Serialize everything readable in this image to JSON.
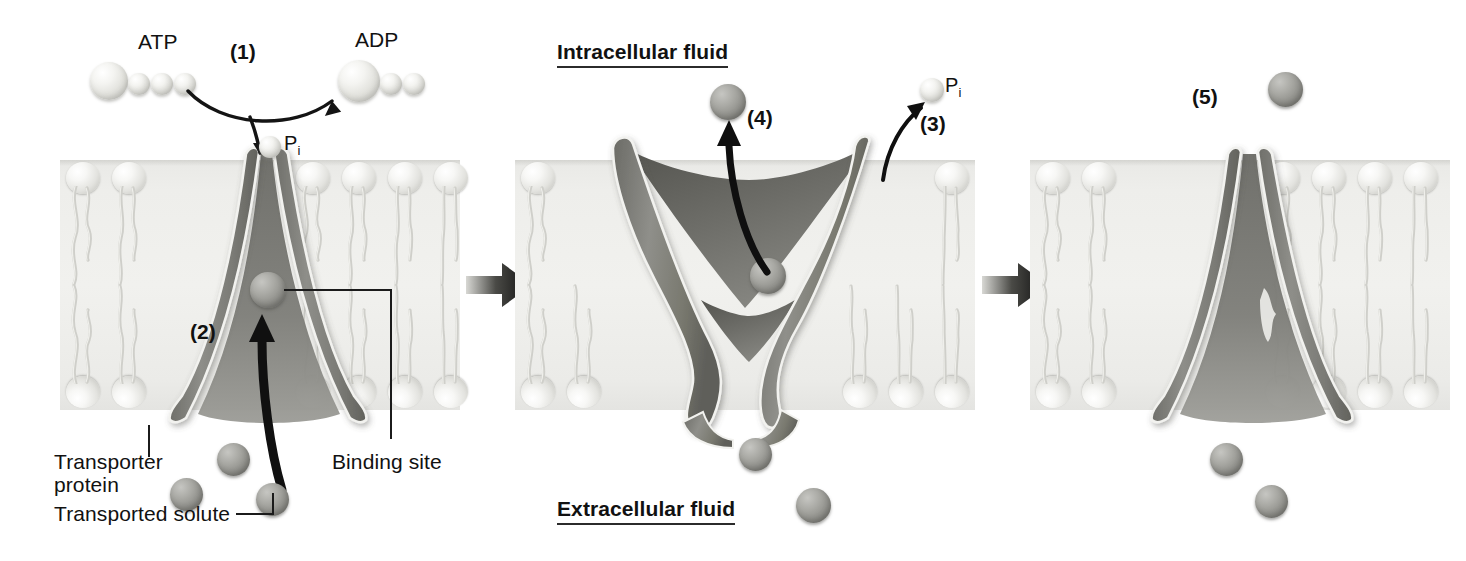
{
  "figure": {
    "type": "cell-membrane-process-diagram",
    "panel_count": 3
  },
  "compartments": {
    "intracellular": "Intracellular fluid",
    "extracellular": "Extracellular fluid"
  },
  "molecules": {
    "atp": "ATP",
    "adp": "ADP",
    "phosphate": "P",
    "phosphate_sub": "i"
  },
  "steps": {
    "s1": "(1)",
    "s2": "(2)",
    "s3": "(3)",
    "s4": "(4)",
    "s5": "(5)"
  },
  "annotations": {
    "transporter_line1": "Transporter",
    "transporter_line2": "protein",
    "solute": "Transported solute",
    "binding_site": "Binding site"
  },
  "colors": {
    "background": "#ffffff",
    "membrane_band": "#eeeeeb",
    "lipid_head": "#e3e3df",
    "protein_fill": "#8d8d88",
    "protein_dark": "#6e6e69",
    "solute_sphere": "#8e8e89",
    "arrow_black": "#111111",
    "text": "#111111"
  },
  "panels": [
    {
      "id": "panel-1",
      "caption": "ATP is hydrolyzed to ADP and phosphate; phosphate binds the transporter while solute binds the binding site",
      "conformation": "open-to-extracellular",
      "steps_shown": [
        "(1)",
        "(2)"
      ],
      "labels": [
        "ATP",
        "ADP",
        "Pi",
        "Transporter protein",
        "Transported solute",
        "Binding site"
      ]
    },
    {
      "id": "panel-2",
      "caption": "Transporter changes shape, releases phosphate and moves solute to the intracellular fluid",
      "conformation": "open-to-intracellular",
      "steps_shown": [
        "(3)",
        "(4)"
      ],
      "labels": [
        "Intracellular fluid",
        "Extracellular fluid",
        "Pi"
      ]
    },
    {
      "id": "panel-3",
      "caption": "Transporter returns to its original conformation",
      "conformation": "open-to-extracellular",
      "steps_shown": [
        "(5)"
      ],
      "labels": []
    }
  ],
  "separators": {
    "arrow_1": "process-arrow",
    "arrow_2": "process-arrow"
  }
}
